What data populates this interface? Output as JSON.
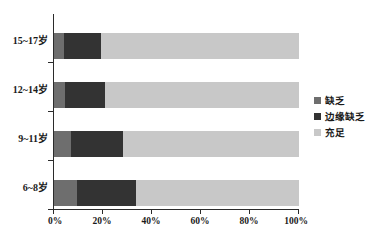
{
  "chart_data": {
    "type": "bar",
    "orientation": "horizontal",
    "stacked": true,
    "normalized": "100%",
    "title": "",
    "subtitle": "",
    "xlabel": "",
    "ylabel": "",
    "categories": [
      "15~17岁",
      "12~14岁",
      "9~11岁",
      "6~8岁"
    ],
    "series": [
      {
        "name": "缺乏",
        "color": "#6e6e6e",
        "values": [
          4.0,
          4.5,
          7.0,
          9.5
        ]
      },
      {
        "name": "边缘缺乏",
        "color": "#333333",
        "values": [
          15.0,
          16.5,
          21.0,
          24.0
        ]
      },
      {
        "name": "充足",
        "color": "#c8c8c8",
        "values": [
          81.0,
          79.0,
          72.0,
          66.5
        ]
      }
    ],
    "xlim": [
      0,
      100
    ],
    "xticks": [
      0,
      20,
      40,
      60,
      80,
      100
    ],
    "xtick_labels": [
      "0%",
      "20%",
      "40%",
      "60%",
      "80%",
      "100%"
    ],
    "grid": false,
    "legend_position": "right"
  },
  "legend": {
    "items": [
      {
        "label": "缺乏",
        "color": "#6e6e6e"
      },
      {
        "label": "边缘缺乏",
        "color": "#333333"
      },
      {
        "label": "充足",
        "color": "#c8c8c8"
      }
    ]
  },
  "axes": {
    "y_categories": [
      "15~17岁",
      "12~14岁",
      "9~11岁",
      "6~8岁"
    ],
    "x_tick_labels": [
      "0%",
      "20%",
      "40%",
      "60%",
      "80%",
      "100%"
    ]
  }
}
